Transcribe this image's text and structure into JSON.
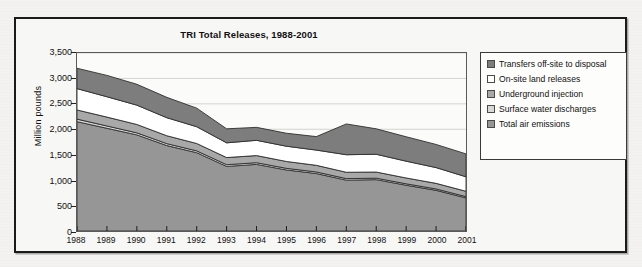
{
  "chart_data": {
    "type": "area",
    "stacked": true,
    "title": "TRI Total Releases, 1988-2001",
    "xlabel": "",
    "ylabel": "Million pounds",
    "ylim": [
      0,
      3500
    ],
    "ytick_step": 500,
    "grid": true,
    "legend_position": "right",
    "categories": [
      "1988",
      "1989",
      "1990",
      "1991",
      "1992",
      "1993",
      "1994",
      "1995",
      "1996",
      "1997",
      "1998",
      "1999",
      "2000",
      "2001"
    ],
    "series": [
      {
        "name": "Total air emissions",
        "color": "#969696",
        "values": [
          2150,
          2020,
          1890,
          1680,
          1540,
          1270,
          1310,
          1200,
          1130,
          1000,
          1010,
          900,
          800,
          650
        ]
      },
      {
        "name": "Surface water discharges",
        "color": "#d8d8d8",
        "values": [
          50,
          45,
          40,
          38,
          36,
          34,
          33,
          32,
          31,
          30,
          29,
          28,
          27,
          26
        ]
      },
      {
        "name": "Underground injection",
        "color": "#a8a8a8",
        "values": [
          180,
          175,
          165,
          155,
          145,
          140,
          140,
          135,
          130,
          125,
          120,
          115,
          110,
          105
        ]
      },
      {
        "name": "On-site land releases",
        "color": "#ffffff",
        "values": [
          420,
          400,
          380,
          355,
          330,
          290,
          300,
          300,
          300,
          345,
          350,
          330,
          310,
          285
        ]
      },
      {
        "name": "Transfers off-site to disposal",
        "color": "#7d7d7d",
        "values": [
          400,
          420,
          410,
          400,
          365,
          275,
          255,
          255,
          265,
          605,
          500,
          480,
          455,
          450
        ]
      }
    ],
    "series_totals": [
      3200,
      3060,
      2885,
      2628,
      2416,
      2009,
      2038,
      1922,
      1856,
      2105,
      2009,
      1853,
      1702,
      1516
    ],
    "y_tick_labels": [
      "0",
      "500",
      "1,000",
      "1,500",
      "2,000",
      "2,500",
      "3,000",
      "3,500"
    ],
    "y_tick_values": [
      0,
      500,
      1000,
      1500,
      2000,
      2500,
      3000,
      3500
    ]
  },
  "legend": {
    "items": [
      {
        "label": "Transfers off-site to disposal",
        "color": "#7d7d7d"
      },
      {
        "label": "On-site land releases",
        "color": "#ffffff"
      },
      {
        "label": "Underground injection",
        "color": "#a8a8a8"
      },
      {
        "label": "Surface water discharges",
        "color": "#d8d8d8"
      },
      {
        "label": "Total air emissions",
        "color": "#969696"
      }
    ]
  }
}
